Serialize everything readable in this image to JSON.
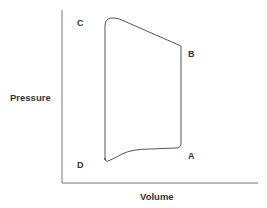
{
  "diagram": {
    "type": "pressure-volume loop",
    "axes": {
      "x_label": "Volume",
      "y_label": "Pressure"
    },
    "points": [
      {
        "id": "A",
        "label": "A"
      },
      {
        "id": "B",
        "label": "B"
      },
      {
        "id": "C",
        "label": "C"
      },
      {
        "id": "D",
        "label": "D"
      }
    ],
    "colors": {
      "line": "#555555",
      "axis": "#666666",
      "text": "#333333"
    }
  }
}
